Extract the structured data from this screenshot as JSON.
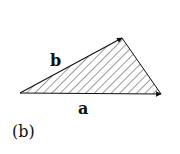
{
  "figure": {
    "panel_label": "(b)",
    "vectors": [
      {
        "name": "a",
        "label": "a"
      },
      {
        "name": "b",
        "label": "b"
      }
    ],
    "fill_pattern": "diagonal-hatch",
    "colors": {
      "stroke": "#111111",
      "background": "#ffffff"
    }
  }
}
